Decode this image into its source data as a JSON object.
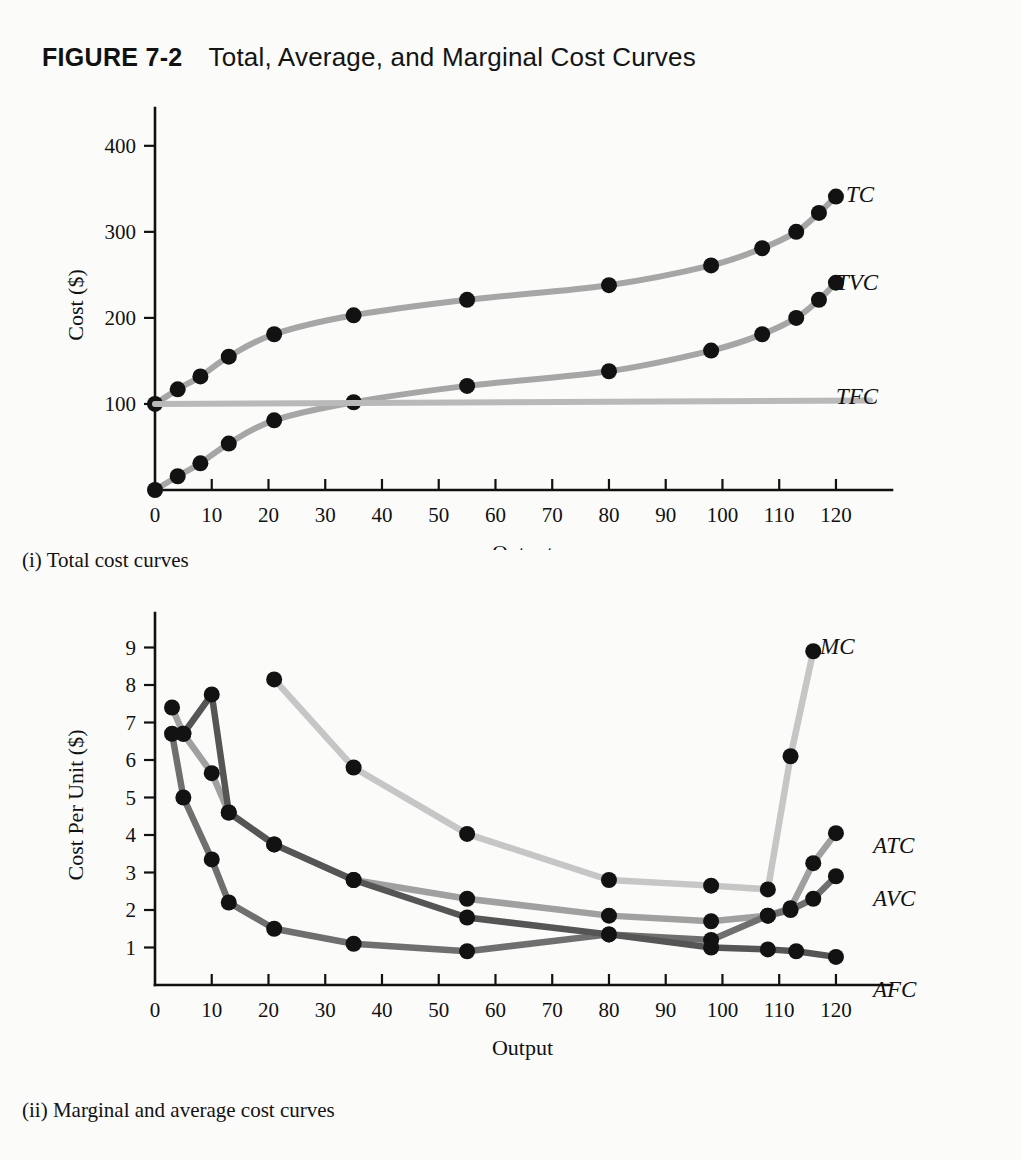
{
  "figure": {
    "number": "FIGURE 7-2",
    "title": "Total, Average, and Marginal Cost Curves"
  },
  "panels": [
    {
      "caption": "(i) Total cost curves"
    },
    {
      "caption": "(ii) Marginal and average cost curves"
    }
  ],
  "chart_data": [
    {
      "type": "line",
      "title": "(i) Total cost curves",
      "xlabel": "Output",
      "ylabel": "Cost ($)",
      "xlim": [
        0,
        126
      ],
      "ylim": [
        0,
        430
      ],
      "xticks": [
        0,
        10,
        20,
        30,
        40,
        50,
        60,
        70,
        80,
        90,
        100,
        110,
        120
      ],
      "yticks": [
        100,
        200,
        300,
        400
      ],
      "grid": false,
      "legend_position": "right-inline",
      "series": [
        {
          "name": "TC",
          "color": "#a6a6a6",
          "markers": true,
          "x": [
            0,
            4,
            8,
            13,
            21,
            35,
            55,
            80,
            98,
            107,
            113,
            117,
            120
          ],
          "y": [
            100,
            117,
            132,
            155,
            181,
            203,
            221,
            238,
            261,
            281,
            300,
            322,
            341
          ]
        },
        {
          "name": "TVC",
          "color": "#a6a6a6",
          "markers": true,
          "x": [
            0,
            4,
            8,
            13,
            21,
            35,
            55,
            80,
            98,
            107,
            113,
            117,
            120
          ],
          "y": [
            0,
            16,
            31,
            54,
            81,
            102,
            121,
            138,
            162,
            181,
            200,
            221,
            241
          ]
        },
        {
          "name": "TFC",
          "color": "#b9b9b9",
          "markers": false,
          "x": [
            0,
            126
          ],
          "y": [
            100,
            104
          ]
        }
      ]
    },
    {
      "type": "line",
      "title": "(ii) Marginal and average cost curves",
      "xlabel": "Output",
      "ylabel": "Cost Per Unit ($)",
      "xlim": [
        0,
        126
      ],
      "ylim": [
        0,
        9.6
      ],
      "xticks": [
        0,
        10,
        20,
        30,
        40,
        50,
        60,
        70,
        80,
        90,
        100,
        110,
        120
      ],
      "yticks": [
        1,
        2,
        3,
        4,
        5,
        6,
        7,
        8,
        9
      ],
      "grid": false,
      "legend_position": "right-inline",
      "series": [
        {
          "name": "MC",
          "color": "#c6c6c6",
          "markers": true,
          "x": [
            21,
            35,
            55,
            80,
            98,
            108,
            112,
            116
          ],
          "y": [
            8.15,
            5.8,
            4.03,
            2.8,
            2.65,
            2.55,
            6.1,
            8.9
          ]
        },
        {
          "name": "ATC",
          "color": "#a0a0a0",
          "markers": true,
          "x": [
            3,
            5,
            10,
            13,
            21,
            35,
            55,
            80,
            98,
            108,
            112,
            116,
            120
          ],
          "y": [
            7.4,
            6.7,
            5.65,
            4.6,
            3.75,
            2.8,
            2.3,
            1.85,
            1.7,
            1.85,
            2.05,
            3.25,
            4.05
          ]
        },
        {
          "name": "AVC",
          "color": "#6f6f6f",
          "markers": true,
          "x": [
            3,
            5,
            10,
            13,
            21,
            35,
            55,
            80,
            98,
            108,
            112,
            116,
            120
          ],
          "y": [
            6.7,
            5.0,
            3.35,
            2.2,
            1.5,
            1.1,
            0.9,
            1.35,
            1.2,
            1.85,
            2.0,
            2.3,
            2.9
          ]
        },
        {
          "name": "AFC",
          "color": "#555555",
          "markers": true,
          "x": [
            5,
            10,
            13,
            21,
            35,
            55,
            80,
            98,
            108,
            113,
            120
          ],
          "y": [
            6.7,
            7.75,
            4.6,
            3.75,
            2.8,
            1.8,
            1.35,
            1.0,
            0.95,
            0.9,
            0.75
          ]
        }
      ]
    }
  ],
  "labels": {
    "chart1": [
      {
        "text": "TC",
        "x": 846,
        "y": 182
      },
      {
        "text": "TVC",
        "x": 836,
        "y": 270
      },
      {
        "text": "TFC",
        "x": 836,
        "y": 384
      }
    ],
    "chart2": [
      {
        "text": "MC",
        "x": 820,
        "y": 634
      },
      {
        "text": "ATC",
        "x": 873,
        "y": 833
      },
      {
        "text": "AVC",
        "x": 873,
        "y": 886
      },
      {
        "text": "AFC",
        "x": 873,
        "y": 977
      }
    ]
  }
}
